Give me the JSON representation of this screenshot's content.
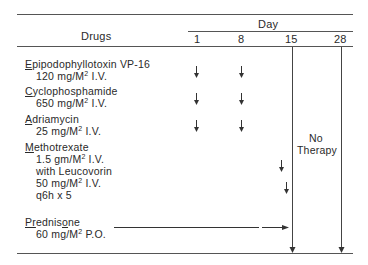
{
  "table": {
    "header": {
      "drugs_label": "Drugs",
      "day_label": "Day",
      "days": [
        "1",
        "8",
        "15",
        "28"
      ]
    },
    "rows": [
      {
        "name_first": "E",
        "name_rest": "pipodophyllotoxin VP-16",
        "dose": "120 mg/M",
        "dose_sup": "2",
        "route": " I.V.",
        "arrows_on_days": [
          "1",
          "8"
        ]
      },
      {
        "name_first": "C",
        "name_rest": "yclophosphamide",
        "dose": "650 mg/M",
        "dose_sup": "2",
        "route": " I.V.",
        "arrows_on_days": [
          "1",
          "8"
        ]
      },
      {
        "name_first": "A",
        "name_rest": "driamycin",
        "dose": "25 mg/M",
        "dose_sup": "2",
        "route": " I.V.",
        "arrows_on_days": [
          "1",
          "8"
        ]
      },
      {
        "name_first": "M",
        "name_rest": "ethotrexate",
        "dose": "1.5 gm/M",
        "dose_sup": "2",
        "route": " I.V.",
        "extra_lines": [
          "with Leucovorin",
          "50 mg/M",
          "q6h x 5"
        ],
        "extra_sup": "2",
        "extra_route": " I.V.",
        "arrows_on_days": [
          "~14",
          "~14.5"
        ]
      },
      {
        "name_first": "Pr",
        "name_mid": "ednis",
        "name_o": "o",
        "name_rest": "ne",
        "dose": "60 mg/M",
        "dose_sup": "2",
        "route": " P.O.",
        "continuous": "Day 1 to Day 15"
      }
    ],
    "no_therapy_label_1": "No",
    "no_therapy_label_2": "Therapy"
  }
}
